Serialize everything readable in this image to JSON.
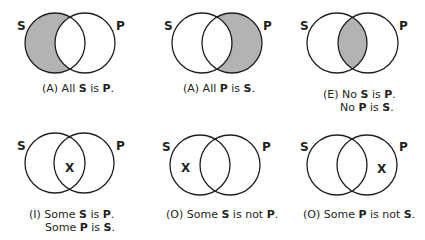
{
  "colors": {
    "shade": "#b3b3b3",
    "stroke": "#231f20",
    "background": "#ffffff"
  },
  "diagrams": [
    {
      "id": "A1",
      "shaded": "S-only",
      "mark": "",
      "label_s": "S",
      "label_p": "P",
      "caption": [
        "(A) All ",
        "S",
        " is ",
        "P",
        "."
      ],
      "caption2": null
    },
    {
      "id": "A2",
      "shaded": "P-only",
      "mark": "",
      "label_s": "S",
      "label_p": "P",
      "caption": [
        "(A) All ",
        "P",
        " is ",
        "S",
        "."
      ],
      "caption2": null
    },
    {
      "id": "E",
      "shaded": "intersection",
      "mark": "",
      "label_s": "S",
      "label_p": "P",
      "caption": [
        "(E) No ",
        "S",
        " is ",
        "P",
        "."
      ],
      "caption2": [
        "No ",
        "P",
        " is ",
        "S",
        "."
      ]
    },
    {
      "id": "I",
      "shaded": "none",
      "mark": "X",
      "mark_region": "intersection",
      "label_s": "S",
      "label_p": "P",
      "caption": [
        "(I) Some ",
        "S",
        " is ",
        "P",
        "."
      ],
      "caption2": [
        "Some ",
        "P",
        " is ",
        "S",
        "."
      ]
    },
    {
      "id": "O1",
      "shaded": "none",
      "mark": "X",
      "mark_region": "S-only",
      "label_s": "S",
      "label_p": "P",
      "caption": [
        "(O) Some ",
        "S",
        " is not ",
        "P",
        "."
      ],
      "caption2": null
    },
    {
      "id": "O2",
      "shaded": "none",
      "mark": "X",
      "mark_region": "P-only",
      "label_s": "S",
      "label_p": "P",
      "caption": [
        "(O) Some ",
        "P",
        " is not ",
        "S",
        "."
      ],
      "caption2": null
    }
  ]
}
